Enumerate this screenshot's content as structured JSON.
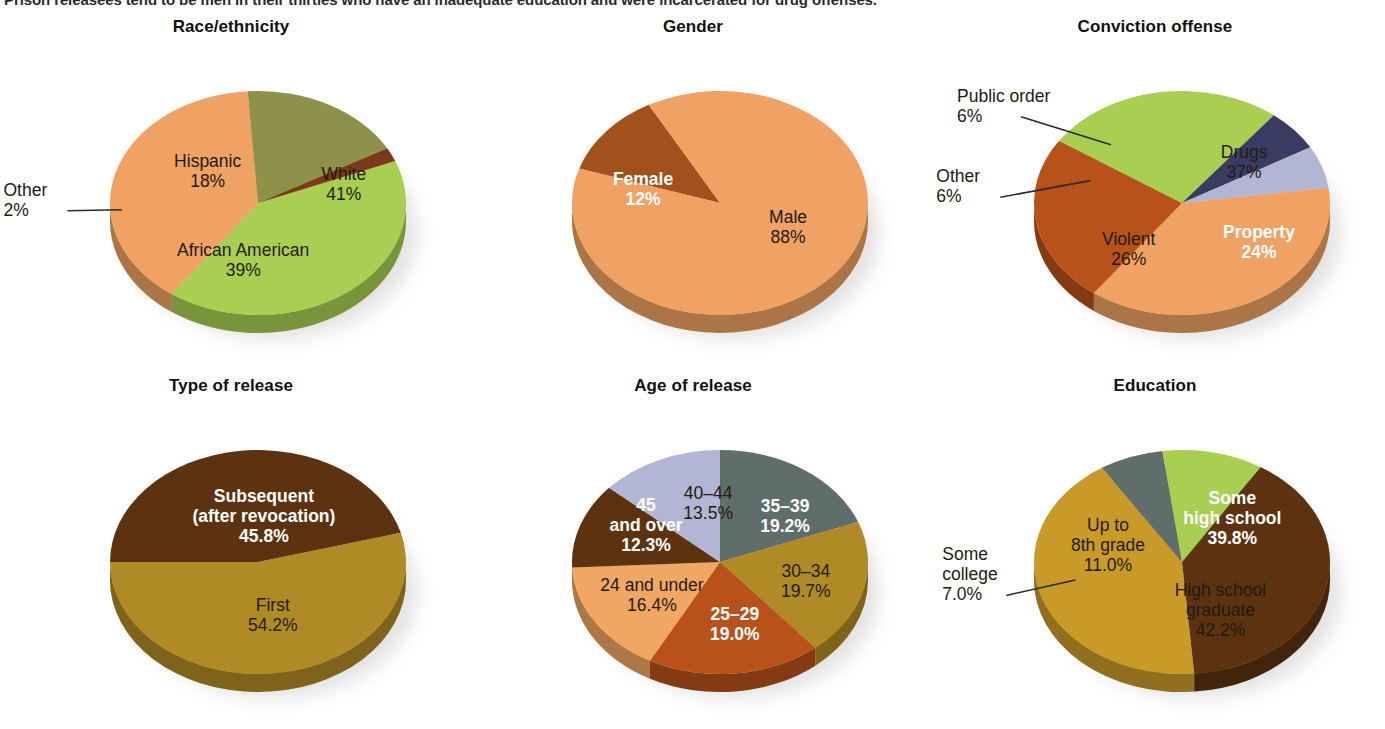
{
  "caption": {
    "text": "Prison releasees tend to be men in their thirties who have an inadequate education and were incarcerated for drug offenses."
  },
  "palette": {
    "light_green": "#a8cf52",
    "orange": "#efa263",
    "olive": "#8e9149",
    "dark_brown": "#5c3211",
    "rust": "#b8521a",
    "navy": "#393b63",
    "lavender": "#b2b6d4",
    "gold": "#b08a24",
    "slate": "#5f6e6b",
    "rim_yellow": "#ecd98d",
    "rim_olive": "#aeb07a",
    "background": "#ffffff",
    "text_dark": "#231a10",
    "text_light": "#ffffff"
  },
  "chart_data": [
    {
      "id": "race-ethnicity",
      "type": "pie",
      "title": "Race/ethnicity",
      "rim_color": "#ecd98d",
      "start_angle": -22,
      "slices": [
        {
          "label": "White",
          "value": 41,
          "display": "41%",
          "color": "#a8cf52",
          "text": "dark",
          "label_pos": "inside",
          "lx": 0.58,
          "ly": -0.16
        },
        {
          "label": "African American",
          "value": 39,
          "display": "39%",
          "color": "#efa263",
          "text": "dark",
          "label_pos": "inside",
          "lx": -0.1,
          "ly": 0.52
        },
        {
          "label": "Hispanic",
          "value": 18,
          "display": "18%",
          "color": "#8e9149",
          "text": "dark",
          "label_pos": "inside",
          "lx": -0.34,
          "ly": -0.28
        },
        {
          "label": "Other",
          "value": 2,
          "display": "2%",
          "color": "#7a3a1c",
          "text": "dark",
          "label_pos": "callout",
          "cx": -1.72,
          "cy": -0.02,
          "ax": -0.92,
          "ay": 0.06
        }
      ]
    },
    {
      "id": "gender",
      "type": "pie",
      "title": "Gender",
      "rim_color": "#ecd98d",
      "start_angle": 198,
      "slices": [
        {
          "label": "Female",
          "value": 12,
          "display": "12%",
          "color": "#a1521c",
          "text": "light",
          "label_pos": "inside",
          "lx": -0.52,
          "ly": -0.12
        },
        {
          "label": "Male",
          "value": 88,
          "display": "88%",
          "color": "#efa263",
          "text": "dark",
          "label_pos": "inside",
          "lx": 0.46,
          "ly": 0.22
        }
      ]
    },
    {
      "id": "conviction-offense",
      "type": "pie",
      "title": "Conviction offense",
      "rim_color": "#ecd98d",
      "start_angle": -8,
      "slices": [
        {
          "label": "Drugs",
          "value": 37,
          "display": "37%",
          "color": "#efa263",
          "text": "dark",
          "label_pos": "inside",
          "lx": 0.42,
          "ly": -0.36
        },
        {
          "label": "Property",
          "value": 24,
          "display": "24%",
          "color": "#b8521a",
          "text": "light",
          "label_pos": "inside",
          "lx": 0.52,
          "ly": 0.36
        },
        {
          "label": "Violent",
          "value": 26,
          "display": "26%",
          "color": "#a8cf52",
          "text": "dark",
          "label_pos": "inside",
          "lx": -0.36,
          "ly": 0.42
        },
        {
          "label": "Other",
          "value": 6,
          "display": "6%",
          "color": "#393b63",
          "text": "dark",
          "label_pos": "callout",
          "cx": -1.66,
          "cy": -0.14,
          "ax": -0.62,
          "ay": -0.2
        },
        {
          "label": "Public order",
          "value": 6,
          "display": "6%",
          "color": "#b2b6d4",
          "text": "dark",
          "label_pos": "callout",
          "cx": -1.52,
          "cy": -0.86,
          "ax": -0.48,
          "ay": -0.52
        }
      ]
    },
    {
      "id": "type-of-release",
      "type": "pie",
      "title": "Type of release",
      "rim_color": "#aeb07a",
      "start_angle": 180,
      "slices": [
        {
          "label": "Subsequent\n(after revocation)",
          "value": 45.8,
          "display": "45.8%",
          "color": "#5c3211",
          "text": "light",
          "label_pos": "inside",
          "lx": 0.04,
          "ly": -0.4
        },
        {
          "label": "First",
          "value": 54.2,
          "display": "54.2%",
          "color": "#b08a24",
          "text": "dark",
          "label_pos": "inside",
          "lx": 0.1,
          "ly": 0.48
        }
      ]
    },
    {
      "id": "age-of-release",
      "type": "pie",
      "title": "Age of release",
      "rim_color": "#ecd98d",
      "start_angle": -90,
      "slices": [
        {
          "label": "35–39",
          "value": 19.2,
          "display": "19.2%",
          "color": "#5f6e6b",
          "text": "light",
          "label_pos": "inside",
          "lx": 0.44,
          "ly": -0.4
        },
        {
          "label": "30–34",
          "value": 19.7,
          "display": "19.7%",
          "color": "#b08a24",
          "text": "dark",
          "label_pos": "inside",
          "lx": 0.58,
          "ly": 0.18
        },
        {
          "label": "25–29",
          "value": 19.0,
          "display": "19.0%",
          "color": "#b8521a",
          "text": "light",
          "label_pos": "inside",
          "lx": 0.1,
          "ly": 0.56
        },
        {
          "label": "24 and under",
          "value": 16.4,
          "display": "16.4%",
          "color": "#f0a763",
          "text": "dark",
          "label_pos": "inside",
          "lx": -0.46,
          "ly": 0.3
        },
        {
          "label": "45\nand over",
          "value": 12.3,
          "display": "12.3%",
          "color": "#5c3211",
          "text": "light",
          "label_pos": "inside",
          "lx": -0.5,
          "ly": -0.32
        },
        {
          "label": "40–44",
          "value": 13.5,
          "display": "13.5%",
          "color": "#b2b6d4",
          "text": "dark",
          "label_pos": "inside",
          "lx": -0.08,
          "ly": -0.52
        }
      ]
    },
    {
      "id": "education",
      "type": "pie",
      "title": "Education",
      "rim_color": "#aeb07a",
      "start_angle": -58,
      "slices": [
        {
          "label": "Some\nhigh school",
          "value": 39.8,
          "display": "39.8%",
          "color": "#5c3211",
          "text": "light",
          "label_pos": "inside",
          "lx": 0.34,
          "ly": -0.38
        },
        {
          "label": "High school\ngraduate",
          "value": 42.2,
          "display": "42.2%",
          "color": "#c99a28",
          "text": "dark",
          "label_pos": "inside",
          "lx": 0.26,
          "ly": 0.44
        },
        {
          "label": "Some\ncollege",
          "value": 7.0,
          "display": "7.0%",
          "color": "#5f6e6b",
          "text": "dark",
          "label_pos": "callout",
          "cx": -1.62,
          "cy": 0.12,
          "ax": -0.72,
          "ay": 0.16
        },
        {
          "label": "Up to\n8th grade",
          "value": 11.0,
          "display": "11.0%",
          "color": "#a8cf52",
          "text": "dark",
          "label_pos": "inside",
          "lx": -0.5,
          "ly": -0.14
        }
      ]
    }
  ]
}
